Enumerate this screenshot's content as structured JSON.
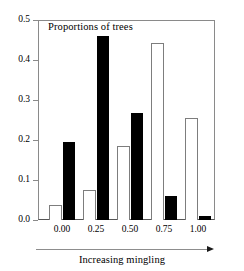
{
  "chart_data": {
    "type": "bar",
    "title": "Proportions of trees",
    "xlabel": "Increasing mingling",
    "ylabel": "",
    "categories": [
      "0.00",
      "0.25",
      "0.50",
      "0.75",
      "1.00"
    ],
    "series": [
      {
        "name": "white-bars",
        "values": [
          0.037,
          0.074,
          0.184,
          0.442,
          0.256
        ]
      },
      {
        "name": "black-bars",
        "values": [
          0.196,
          0.459,
          0.268,
          0.059,
          0.01
        ]
      }
    ],
    "ylim": [
      0.0,
      0.5
    ],
    "yticks": [
      "0.0",
      "0.1",
      "0.2",
      "0.3",
      "0.4",
      "0.5"
    ],
    "ytick_values": [
      0.0,
      0.1,
      0.2,
      0.3,
      0.4,
      0.5
    ],
    "grid": false,
    "legend": "none",
    "colors": {
      "white_bar_fill": "#ffffff",
      "white_bar_edge": "#7d7d7d",
      "black_bar_fill": "#000000",
      "axis": "#8a8a8a",
      "text": "#000000"
    },
    "annotations": [
      {
        "name": "mingling-arrow",
        "direction": "right",
        "caption": "Increasing mingling"
      }
    ]
  }
}
